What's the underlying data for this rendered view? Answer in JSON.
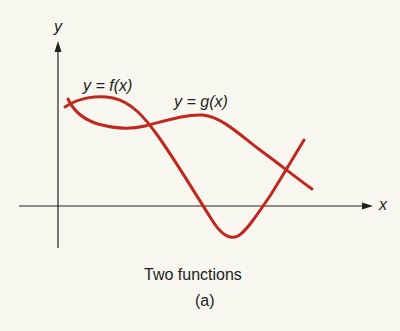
{
  "figure": {
    "y_axis_label": "y",
    "x_axis_label": "x",
    "curve_f_label": "y = f(x)",
    "curve_g_label": "y = g(x)",
    "caption": "Two functions",
    "subcaption": "(a)",
    "colors": {
      "curve": "#c0281f",
      "axis": "#222222",
      "background": "#f8f7ef"
    }
  }
}
